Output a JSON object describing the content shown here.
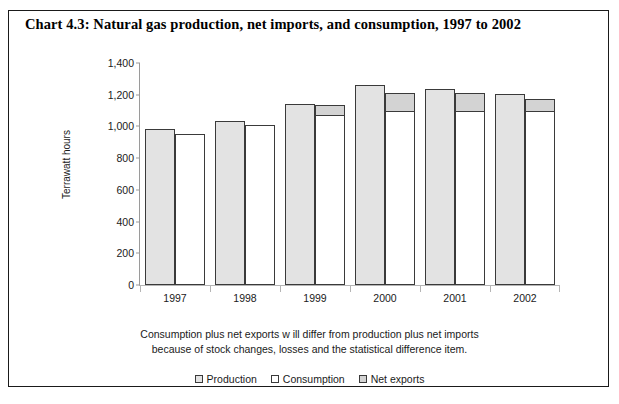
{
  "chart_data": {
    "type": "bar",
    "title": "Chart 4.3: Natural gas production, net imports, and consumption, 1997 to 2002",
    "xlabel": "",
    "ylabel": "Terrawatt hours",
    "ylim": [
      0,
      1400
    ],
    "yticks": [
      0,
      200,
      400,
      600,
      800,
      1000,
      1200,
      1400
    ],
    "ytick_labels": [
      "0",
      "200",
      "400",
      "600",
      "800",
      "1,000",
      "1,200",
      "1,400"
    ],
    "grid": false,
    "legend_position": "bottom",
    "categories": [
      "1997",
      "1998",
      "1999",
      "2000",
      "2001",
      "2002"
    ],
    "series": [
      {
        "name": "Production",
        "values": [
          985,
          1035,
          1140,
          1260,
          1235,
          1205
        ]
      },
      {
        "name": "Consumption",
        "values": [
          950,
          1010,
          1075,
          1100,
          1100,
          1100
        ]
      },
      {
        "name": "Net exports",
        "values": [
          0,
          0,
          65,
          120,
          115,
          80
        ]
      }
    ],
    "stacked_second_bar": [
      "Consumption",
      "Net exports"
    ],
    "annotations": [
      "Consumption plus net exports w ill differ from production plus net imports",
      "because of stock changes, losses and the statistical difference item."
    ]
  },
  "legend": {
    "items": [
      {
        "label": "Production",
        "color": "#e3e3e3"
      },
      {
        "label": "Consumption",
        "color": "#ffffff"
      },
      {
        "label": "Net exports",
        "color": "#d3d3d3"
      }
    ]
  },
  "colors": {
    "production": "#e3e3e3",
    "consumption": "#ffffff",
    "net_exports": "#d3d3d3",
    "border": "#3a3a3a",
    "axis": "#9a9a9a",
    "text": "#1a1a1a",
    "frame": "#1a1a1a",
    "background": "#ffffff"
  }
}
